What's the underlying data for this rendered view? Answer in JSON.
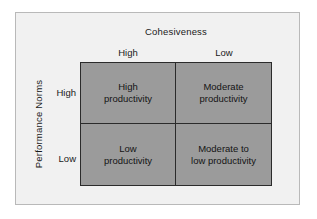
{
  "figure": {
    "type": "2x2-matrix-diagram",
    "colors": {
      "page_background": "#ffffff",
      "panel_background": "#f1f1f1",
      "panel_border": "#b9b9b9",
      "cell_fill": "#9b9b9b",
      "grid_line": "#2b2b2b",
      "text": "#141414"
    }
  },
  "axes": {
    "top": {
      "title": "Cohesiveness",
      "categories": [
        "High",
        "Low"
      ]
    },
    "left": {
      "title": "Performance Norms",
      "categories": [
        "High",
        "Low"
      ]
    }
  },
  "cells": [
    {
      "row": "High",
      "column": "High",
      "label": "High\nproductivity"
    },
    {
      "row": "High",
      "column": "Low",
      "label": "Moderate\nproductivity"
    },
    {
      "row": "Low",
      "column": "High",
      "label": "Low\nproductivity"
    },
    {
      "row": "Low",
      "column": "Low",
      "label": "Moderate to\nlow productivity"
    }
  ]
}
